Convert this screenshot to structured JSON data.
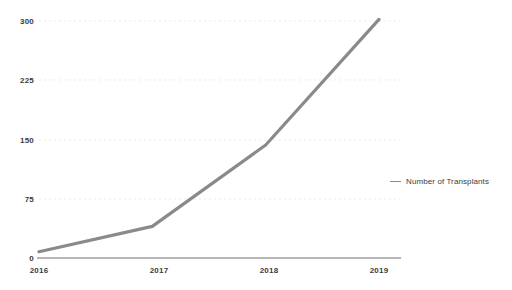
{
  "chart_data": {
    "type": "line",
    "title": "",
    "subtitle": "",
    "xlabel": "",
    "ylabel": "",
    "categories": [
      "2016",
      "2017",
      "2018",
      "2019"
    ],
    "series": [
      {
        "name": "Number of Transplants",
        "values": [
          8,
          40,
          143,
          302
        ],
        "color": "#8a8a8a"
      }
    ],
    "ylim": [
      0,
      300
    ],
    "yticks": [
      0,
      75,
      150,
      225,
      300
    ],
    "ytick_labels": [
      "0",
      "75",
      "150",
      "225",
      "300"
    ],
    "xtick_labels": [
      "2016",
      "2017",
      "2018",
      "2019"
    ],
    "grid": true,
    "grid_style": "dotted-horizontal",
    "legend_position": "right"
  },
  "axes": {
    "y_ticks": [
      {
        "label": "300"
      },
      {
        "label": "225"
      },
      {
        "label": "150"
      },
      {
        "label": "75"
      },
      {
        "label": "0"
      }
    ],
    "x_ticks": [
      {
        "label": "2016"
      },
      {
        "label": "2017"
      },
      {
        "label": "2018"
      },
      {
        "label": "2019"
      }
    ]
  },
  "legend": {
    "items": [
      {
        "label": "Number of Transplants",
        "color": "#8a8a8a"
      }
    ]
  },
  "colors": {
    "series": "#8a8a8a",
    "axis": "#6f6f6f",
    "grid": "#d9d9d9",
    "text": "#3b3b3b",
    "background": "#ffffff"
  }
}
